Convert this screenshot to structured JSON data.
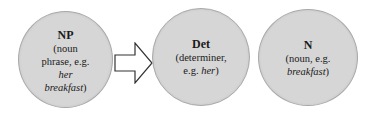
{
  "diagram": {
    "nodes": [
      {
        "id": "np",
        "title": "NP",
        "desc_line1": "(noun",
        "desc_line2": "phrase, e.g.",
        "desc_line3_italic": "her",
        "desc_line4_italic": "breakfast",
        "desc_line4_close": ")"
      },
      {
        "id": "det",
        "title": "Det",
        "desc_line1": "(determiner,",
        "desc_line2_prefix": "e.g. ",
        "desc_line2_italic": "her",
        "desc_line2_close": ")"
      },
      {
        "id": "n",
        "title": "N",
        "desc_line1": "(noun, e.g.",
        "desc_line2_italic": "breakfast",
        "desc_line2_close": ")"
      }
    ],
    "arrow": {
      "icon": "right-block-arrow-icon",
      "from": "NP",
      "to": "Det"
    },
    "colors": {
      "node_fill": "#d6d6d6",
      "node_border": "#a8a8a8",
      "arrow_fill": "#ffffff",
      "arrow_stroke": "#333333"
    }
  }
}
